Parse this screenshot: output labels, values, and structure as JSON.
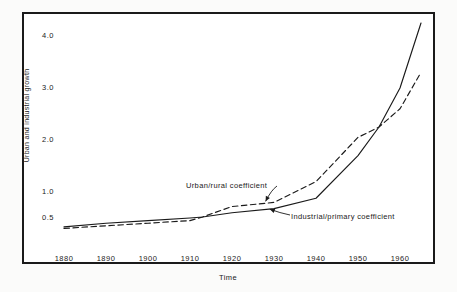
{
  "chart_data": {
    "type": "line",
    "title": "",
    "xlabel": "Time",
    "ylabel": "Urban and industrial growth",
    "xlim": [
      1880,
      1965
    ],
    "ylim": [
      0.28,
      4.3
    ],
    "grid": false,
    "legend_position": "inline-annotations",
    "xticks": [
      "1880",
      "1890",
      "1900",
      "1910",
      "1920",
      "1930",
      "1940",
      "1950",
      "1960"
    ],
    "xtick_values": [
      1880,
      1890,
      1900,
      1910,
      1920,
      1930,
      1940,
      1950,
      1960
    ],
    "yticks": [
      "0.5",
      "1.0",
      "2.0",
      "3.0",
      "4.0"
    ],
    "ytick_values": [
      0.5,
      1.0,
      2.0,
      3.0,
      4.0
    ],
    "series": [
      {
        "name": "Urban/rural coefficient",
        "style": "dashed",
        "color": "#1a1a1a",
        "x": [
          1880,
          1890,
          1900,
          1910,
          1913,
          1920,
          1925,
          1930,
          1940,
          1950,
          1955,
          1960,
          1965
        ],
        "values": [
          0.3,
          0.35,
          0.4,
          0.45,
          0.52,
          0.72,
          0.76,
          0.8,
          1.2,
          2.05,
          2.25,
          2.6,
          3.3
        ]
      },
      {
        "name": "Industrial/primary coefficient",
        "style": "solid",
        "color": "#1a1a1a",
        "x": [
          1880,
          1890,
          1900,
          1910,
          1913,
          1920,
          1930,
          1940,
          1950,
          1955,
          1960,
          1965
        ],
        "values": [
          0.33,
          0.4,
          0.45,
          0.5,
          0.52,
          0.6,
          0.68,
          0.88,
          1.7,
          2.25,
          3.0,
          4.25
        ]
      }
    ],
    "annotations": [
      {
        "name": "Urban/rural coefficient",
        "text": "Urban/rural coefficient",
        "target_x": 1928,
        "target_y": 0.82
      },
      {
        "name": "Industrial/primary coefficient",
        "text": "Industrial/primary coefficient",
        "target_x": 1929,
        "target_y": 0.67
      }
    ]
  },
  "axis": {
    "y_title": "Urban and industrial growth",
    "x_title": "Time",
    "y_labels": [
      "4.0",
      "3.0",
      "2.0",
      "1.0",
      "0.5"
    ],
    "x_labels": [
      "1880",
      "1890",
      "1900",
      "1910",
      "1920",
      "1930",
      "1940",
      "1950",
      "1960"
    ]
  },
  "annotations": {
    "urban_label": "Urban/rural coefficient",
    "industrial_label": "Industrial/primary coefficient"
  },
  "colors": {
    "ink": "#1a1a1a",
    "paper": "#ffffff",
    "page": "#fbfbfa"
  }
}
